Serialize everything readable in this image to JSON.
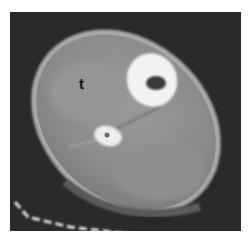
{
  "image": {
    "type": "CT cross-section of lower leg",
    "annotations": [
      {
        "text": "t",
        "x": 84,
        "y": 85
      }
    ],
    "colors": {
      "background": "#2a2a2a",
      "soft_tissue": "#8e8e8e",
      "bone": "#f2f2f2",
      "marrow": "#3a3a3a",
      "margin": "#ffffff"
    }
  }
}
